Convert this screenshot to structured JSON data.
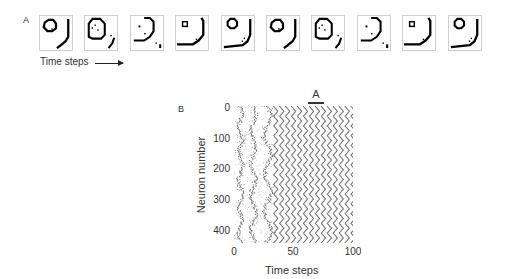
{
  "panel_a": {
    "label": "A",
    "caption": "Time steps",
    "frame_count": 10,
    "frames": [
      {
        "index": 1,
        "description": "ring top-left with closing arc bottom-right"
      },
      {
        "index": 2,
        "description": "expanding ring with scattered dots"
      },
      {
        "index": 3,
        "description": "expanding arc with dots"
      },
      {
        "index": 4,
        "description": "small square nucleus, large arc"
      },
      {
        "index": 5,
        "description": "ring reformed top-left"
      },
      {
        "index": 6,
        "description": "ring top-left with closing arc bottom-right"
      },
      {
        "index": 7,
        "description": "expanding ring with scattered dots"
      },
      {
        "index": 8,
        "description": "expanding arc with dots"
      },
      {
        "index": 9,
        "description": "small square nucleus, large arc"
      },
      {
        "index": 10,
        "description": "ring reformed top-left"
      }
    ]
  },
  "panel_b": {
    "label": "B",
    "marker_label": "A"
  },
  "chart_data": {
    "type": "scatter",
    "title": "",
    "xlabel": "Time steps",
    "ylabel": "Neuron number",
    "xlim": [
      0,
      100
    ],
    "ylim": [
      450,
      0
    ],
    "xticks": [
      "0",
      "50",
      "100"
    ],
    "yticks": [
      "0",
      "100",
      "200",
      "300",
      "400"
    ],
    "grid": false,
    "annotations": [
      {
        "text": "A",
        "x_range": [
          62,
          74
        ],
        "position": "above plot"
      }
    ],
    "regimes": [
      {
        "t_start": 0,
        "t_end": 30,
        "pattern": "irregular vertical bands"
      },
      {
        "t_start": 30,
        "t_end": 100,
        "pattern": "periodic diagonal stripes, period ~5 time steps"
      }
    ]
  }
}
